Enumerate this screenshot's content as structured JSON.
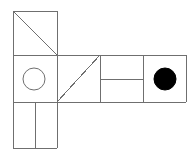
{
  "canvas": {
    "width": 196,
    "height": 157,
    "background_color": "#ffffff"
  },
  "figure": {
    "name": "geometric-net-figure",
    "stroke_color": "#6f6f6f",
    "stroke_width": 1,
    "fill_color": "#000000",
    "cell_size": 45
  },
  "chart_data": {
    "type": "diagram",
    "title": "",
    "grid": {
      "x_lines": [
        13,
        57,
        100,
        143,
        186
      ],
      "y_lines": [
        11,
        55,
        102,
        148
      ]
    },
    "cells": [
      {
        "name": "top-left-cell",
        "x": 13,
        "y": 11,
        "width": 44,
        "height": 44,
        "content": "diagonal-tl-br"
      },
      {
        "name": "middle-left-cell",
        "x": 13,
        "y": 55,
        "width": 44,
        "height": 47,
        "content": "outline-circle"
      },
      {
        "name": "bottom-left-cell",
        "x": 13,
        "y": 102,
        "width": 44,
        "height": 46,
        "content": "vertical-split"
      },
      {
        "name": "middle-center-cell",
        "x": 57,
        "y": 55,
        "width": 43,
        "height": 47,
        "content": "diagonal-bl-tr"
      },
      {
        "name": "middle-right-cell",
        "x": 100,
        "y": 55,
        "width": 43,
        "height": 47,
        "content": "horizontal-split"
      },
      {
        "name": "far-right-cell",
        "x": 143,
        "y": 55,
        "width": 43,
        "height": 47,
        "content": "filled-circle"
      }
    ],
    "shapes": [
      {
        "name": "outline-circle",
        "type": "circle",
        "cx": 34,
        "cy": 79,
        "r": 11,
        "fill": "none",
        "stroke": "#6f6f6f"
      },
      {
        "name": "filled-circle",
        "type": "circle",
        "cx": 165,
        "cy": 79,
        "r": 11,
        "fill": "#000000",
        "stroke": "#000000"
      }
    ],
    "lines": [
      {
        "name": "outline-top-left-square-top",
        "x1": 13,
        "y1": 11,
        "x2": 57,
        "y2": 11
      },
      {
        "name": "outline-top-left-square-right",
        "x1": 57,
        "y1": 11,
        "x2": 57,
        "y2": 55
      },
      {
        "name": "outline-top-left-square-left",
        "x1": 13,
        "y1": 11,
        "x2": 13,
        "y2": 55
      },
      {
        "name": "diagonal-top-left",
        "x1": 13,
        "y1": 11,
        "x2": 57,
        "y2": 55
      },
      {
        "name": "row-divider-upper",
        "x1": 13,
        "y1": 55,
        "x2": 186,
        "y2": 55
      },
      {
        "name": "left-column-edge",
        "x1": 13,
        "y1": 55,
        "x2": 13,
        "y2": 148
      },
      {
        "name": "row-divider-lower",
        "x1": 13,
        "y1": 102,
        "x2": 186,
        "y2": 102
      },
      {
        "name": "bottom-left-square-bottom",
        "x1": 13,
        "y1": 148,
        "x2": 57,
        "y2": 148
      },
      {
        "name": "bottom-left-square-right",
        "x1": 57,
        "y1": 102,
        "x2": 57,
        "y2": 148
      },
      {
        "name": "bottom-left-square-split",
        "x1": 35,
        "y1": 102,
        "x2": 35,
        "y2": 148
      },
      {
        "name": "column-divider-1",
        "x1": 57,
        "y1": 55,
        "x2": 57,
        "y2": 102
      },
      {
        "name": "diagonal-middle-center",
        "x1": 57,
        "y1": 102,
        "x2": 100,
        "y2": 55
      },
      {
        "name": "column-divider-2",
        "x1": 100,
        "y1": 55,
        "x2": 100,
        "y2": 102
      },
      {
        "name": "middle-right-horizontal-split",
        "x1": 100,
        "y1": 79,
        "x2": 143,
        "y2": 79
      },
      {
        "name": "column-divider-3",
        "x1": 143,
        "y1": 55,
        "x2": 143,
        "y2": 102
      },
      {
        "name": "right-outer-edge",
        "x1": 186,
        "y1": 55,
        "x2": 186,
        "y2": 102
      }
    ]
  }
}
